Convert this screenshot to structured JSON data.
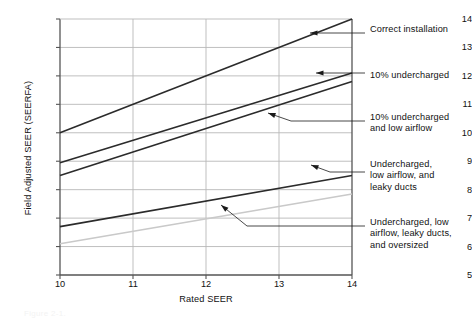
{
  "figure": {
    "caption": "Figure 2-1."
  },
  "chart_data": {
    "type": "line",
    "title": "",
    "xlabel": "Rated SEER",
    "ylabel": "Field Adjusted SEER (SEERFA)",
    "xlim": [
      10,
      14
    ],
    "ylim": [
      5,
      14
    ],
    "xticks": [
      10,
      11,
      12,
      13,
      14
    ],
    "yticks": [
      5,
      6,
      7,
      8,
      9,
      10,
      11,
      12,
      13,
      14
    ],
    "xticklabels": [
      "10",
      "11",
      "12",
      "13",
      "14"
    ],
    "yticklabels": [
      "5",
      "6",
      "7",
      "8",
      "9",
      "10",
      "11",
      "12",
      "13",
      "14"
    ],
    "grid": true,
    "legend_position": "annotations-right",
    "x": [
      10,
      14
    ],
    "series": [
      {
        "name": "Correct installation",
        "values": [
          10.0,
          14.0
        ],
        "color": "#2b2b2b",
        "width": 1.6
      },
      {
        "name": "10% undercharged",
        "values": [
          8.95,
          12.1
        ],
        "color": "#2b2b2b",
        "width": 1.6
      },
      {
        "name": "10% undercharged and low airflow",
        "values": [
          8.5,
          11.8
        ],
        "color": "#2b2b2b",
        "width": 1.6
      },
      {
        "name": "Undercharged, low airflow, and leaky ducts",
        "values": [
          6.7,
          8.5
        ],
        "color": "#2b2b2b",
        "width": 1.6
      },
      {
        "name": "Undercharged, low airflow, leaky ducts, and oversized",
        "values": [
          6.1,
          7.85
        ],
        "color": "#c9c9c9",
        "width": 1.6
      }
    ],
    "annotations": [
      {
        "label": "Correct installation",
        "text_x": 370,
        "text_y": 24,
        "arrow_tip_x": 310,
        "arrow_tip_y": 33,
        "elbow_x": 352,
        "elbow_y": 33,
        "leader_end_x": 365,
        "leader_end_y": 33
      },
      {
        "label": "10% undercharged",
        "text_x": 370,
        "text_y": 70,
        "arrow_tip_x": 316,
        "arrow_tip_y": 73,
        "elbow_x": 352,
        "elbow_y": 73,
        "leader_end_x": 365,
        "leader_end_y": 73
      },
      {
        "label": "10% undercharged\nand low airflow",
        "text_x": 370,
        "text_y": 112,
        "arrow_tip_x": 268,
        "arrow_tip_y": 113,
        "elbow_x": 291,
        "elbow_y": 121,
        "leader_end_x": 365,
        "leader_end_y": 121
      },
      {
        "label": "Undercharged,\nlow airflow, and\nleaky ducts",
        "text_x": 370,
        "text_y": 159,
        "arrow_tip_x": 311,
        "arrow_tip_y": 165,
        "elbow_x": 330,
        "elbow_y": 172,
        "leader_end_x": 365,
        "leader_end_y": 172
      },
      {
        "label": "Undercharged, low\nairflow, leaky ducts,\nand oversized",
        "text_x": 370,
        "text_y": 217,
        "arrow_tip_x": 221,
        "arrow_tip_y": 205,
        "elbow_x": 247,
        "elbow_y": 226,
        "leader_end_x": 365,
        "leader_end_y": 226
      }
    ],
    "plot_rect": {
      "left": 60,
      "top": 19,
      "right": 352,
      "bottom": 275
    },
    "colors": {
      "axis": "#555555",
      "grid": "#b8b8b8",
      "line_dark": "#2b2b2b",
      "line_light": "#c9c9c9",
      "text": "#111111"
    }
  }
}
